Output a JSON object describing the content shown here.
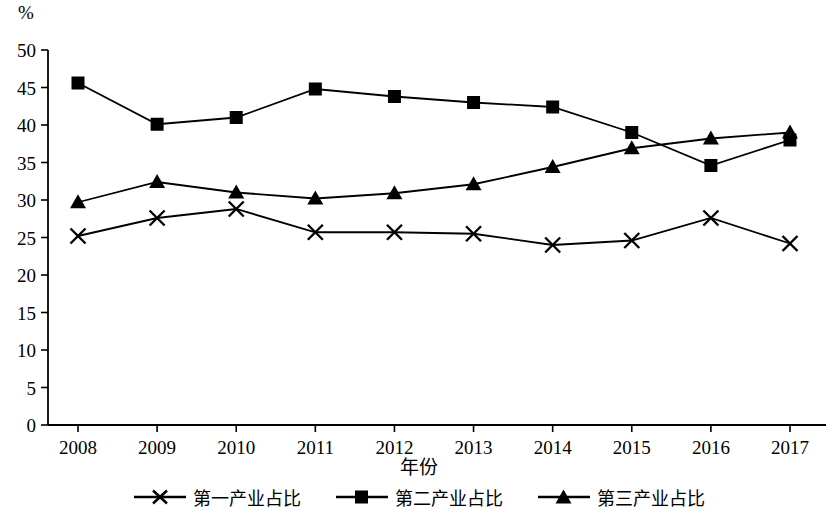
{
  "chart_data": {
    "type": "line",
    "title": "",
    "xlabel": "年份",
    "ylabel": "%",
    "ylim": [
      0,
      50
    ],
    "ytick_step": 5,
    "yticks": [
      "0",
      "5",
      "10",
      "15",
      "20",
      "25",
      "30",
      "35",
      "40",
      "45",
      "50"
    ],
    "grid": false,
    "legend_position": "bottom",
    "categories": [
      "2008",
      "2009",
      "2010",
      "2011",
      "2012",
      "2013",
      "2014",
      "2015",
      "2016",
      "2017"
    ],
    "x": [
      2008,
      2009,
      2010,
      2011,
      2012,
      2013,
      2014,
      2015,
      2016,
      2017
    ],
    "series": [
      {
        "name": "第一产业占比",
        "marker": "x",
        "color": "#000000",
        "values": [
          25.2,
          27.6,
          28.8,
          25.7,
          25.7,
          25.5,
          24.0,
          24.6,
          27.6,
          24.2
        ]
      },
      {
        "name": "第二产业占比",
        "marker": "square",
        "color": "#000000",
        "values": [
          45.6,
          40.1,
          41.0,
          44.8,
          43.8,
          43.0,
          42.4,
          39.0,
          34.6,
          38.0
        ]
      },
      {
        "name": "第三产业占比",
        "marker": "triangle",
        "color": "#000000",
        "values": [
          29.7,
          32.4,
          31.0,
          30.2,
          30.9,
          32.1,
          34.4,
          36.9,
          38.2,
          39.0
        ]
      }
    ]
  },
  "axes": {
    "unit_label": "%",
    "x_title": "年份"
  },
  "legend": {
    "items": [
      {
        "label": "第一产业占比",
        "marker": "x-marker"
      },
      {
        "label": "第二产业占比",
        "marker": "square-marker"
      },
      {
        "label": "第三产业占比",
        "marker": "triangle-marker"
      }
    ]
  }
}
